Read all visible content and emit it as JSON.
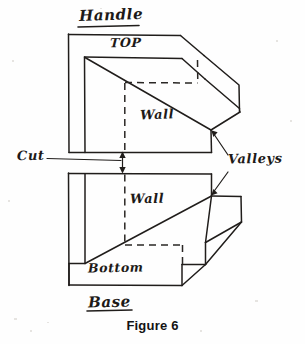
{
  "figure": {
    "caption": "Figure 6",
    "background_color": "#fefefe",
    "ink_color": "#201d1b",
    "style": "hand-drawn pen sketch, isometric"
  },
  "labels": {
    "handle": "Handle",
    "top": "TOP",
    "wall_top": "Wall",
    "cut": "Cut",
    "valleys": "Valleys",
    "wall_bottom": "Wall",
    "bottom": "Bottom",
    "base": "Base"
  },
  "annotations": {
    "cut_note": "Cut",
    "cut_arrow": "double-headed-vertical-arrow",
    "valleys_note": "Valleys",
    "valleys_arrows": 2
  },
  "parts": [
    {
      "name": "Handle",
      "faces": [
        "TOP",
        "Wall"
      ],
      "underlined_title": true
    },
    {
      "name": "Base",
      "faces": [
        "Wall",
        "Bottom"
      ],
      "underlined_title": true
    }
  ]
}
